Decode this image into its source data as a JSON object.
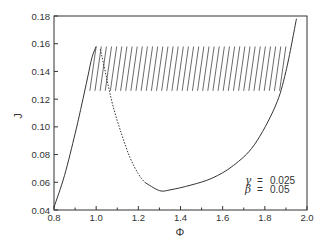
{
  "chart_data": {
    "type": "line",
    "title": "",
    "xlabel": "Φ",
    "ylabel": "J",
    "xlim": [
      0.8,
      2.0
    ],
    "ylim": [
      0.04,
      0.18
    ],
    "xticks": [
      0.8,
      1.0,
      1.2,
      1.4,
      1.6,
      1.8,
      2.0
    ],
    "xtick_labels": [
      "0.8",
      "1.0",
      "1.2",
      "1.4",
      "1.6",
      "1.8",
      "2.0"
    ],
    "yticks": [
      0.04,
      0.06,
      0.08,
      0.1,
      0.12,
      0.14,
      0.16,
      0.18
    ],
    "ytick_labels": [
      "0.04",
      "0.06",
      "0.08",
      "0.10",
      "0.12",
      "0.14",
      "0.16",
      "0.18"
    ],
    "grid": false,
    "legend": null,
    "annotations": [
      {
        "symbol": "γ",
        "eq": "=",
        "value": "0.025"
      },
      {
        "symbol": "β",
        "eq": "=",
        "value": "0.05"
      }
    ],
    "series": [
      {
        "name": "stable branch (lower)",
        "style": "solid",
        "x": [
          0.8,
          0.85,
          0.9,
          0.93,
          0.96,
          0.98,
          1.0
        ],
        "y": [
          0.042,
          0.065,
          0.095,
          0.115,
          0.136,
          0.15,
          0.158
        ]
      },
      {
        "name": "unstable branch",
        "style": "dotted",
        "x": [
          1.02,
          1.05,
          1.08,
          1.12,
          1.16,
          1.2,
          1.23
        ],
        "y": [
          0.156,
          0.135,
          0.115,
          0.095,
          0.078,
          0.066,
          0.06
        ]
      },
      {
        "name": "stable branch (upper)",
        "style": "solid",
        "x": [
          1.23,
          1.3,
          1.35,
          1.45,
          1.55,
          1.65,
          1.75,
          1.85,
          1.9,
          1.95
        ],
        "y": [
          0.06,
          0.054,
          0.0545,
          0.058,
          0.063,
          0.072,
          0.087,
          0.115,
          0.14,
          0.178
        ]
      },
      {
        "name": "periodic orbits (hatched band)",
        "style": "hatch",
        "y_range": [
          0.126,
          0.158
        ],
        "x_start": 0.97,
        "x_end": 1.87,
        "count": 38
      }
    ]
  }
}
